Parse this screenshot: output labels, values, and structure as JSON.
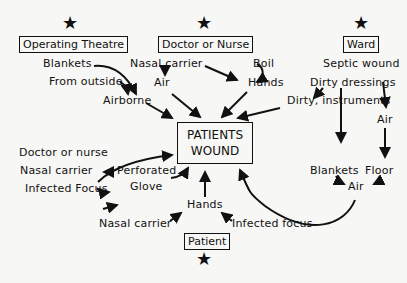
{
  "diagram": {
    "sources": {
      "operating_theatre": "Operating Theatre",
      "doctor_or_nurse": "Doctor or Nurse",
      "ward": "Ward",
      "patient": "Patient"
    },
    "star_icon": "★",
    "center": {
      "line1": "PATIENTS",
      "line2": "WOUND"
    },
    "theatre_nodes": {
      "blankets": "Blankets",
      "from_outside": "From outside",
      "airborne": "Airborne"
    },
    "doctor_nodes": {
      "nasal_carrier": "Nasal carrier",
      "air": "Air",
      "boil": "Boil",
      "hands": "Hands"
    },
    "ward_nodes": {
      "septic_wound": "Septic wound",
      "dirty_dressings": "Dirty dressings",
      "dirty_instruments": "Dirty, instruments",
      "air": "Air",
      "blankets": "Blankets",
      "floor": "Floor",
      "air2": "Air"
    },
    "glove_nodes": {
      "doctor_or_nurse": "Doctor or nurse",
      "nasal_carrier": "Nasal carrier",
      "infected_focus": "Infected Focus",
      "perforated": "Perforated",
      "glove": "Glove"
    },
    "patient_nodes": {
      "hands": "Hands",
      "nasal_carrier": "Nasal carrier",
      "infected_focus": "Infected focus"
    }
  }
}
